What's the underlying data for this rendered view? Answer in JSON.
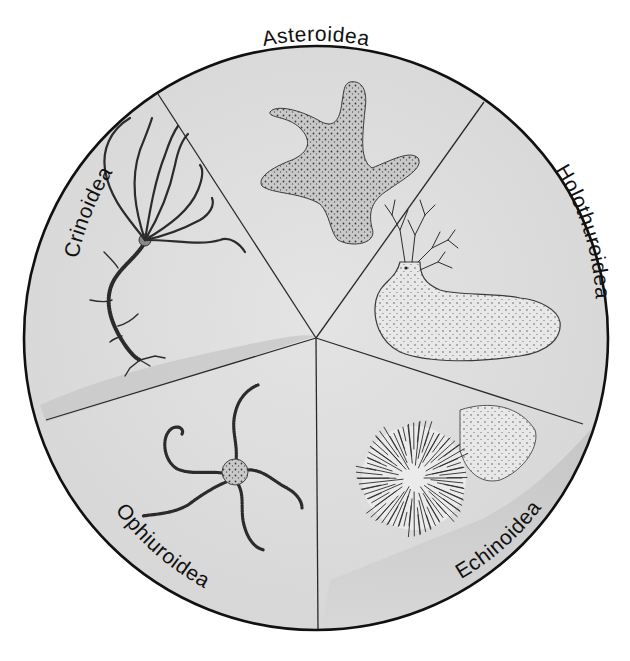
{
  "diagram": {
    "background_color": "#ffffff",
    "disc_fill": "#dedede",
    "rim_color": "#111111",
    "divider_color": "#2a2a2a",
    "center": {
      "x": 316,
      "y": 338
    },
    "radius": 292,
    "segments": [
      {
        "label": "Asteroidea",
        "organism": "sea star",
        "position": "top"
      },
      {
        "label": "Holothuroidea",
        "organism": "sea cucumber",
        "position": "right"
      },
      {
        "label": "Echinoidea",
        "organism": "sea urchin",
        "position": "bottom-right"
      },
      {
        "label": "Ophiuroidea",
        "organism": "brittle star",
        "position": "bottom-left"
      },
      {
        "label": "Crinoidea",
        "organism": "sea lily",
        "position": "left"
      }
    ]
  }
}
